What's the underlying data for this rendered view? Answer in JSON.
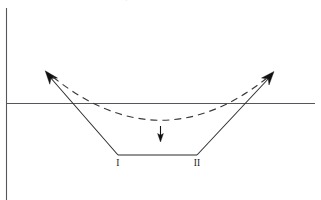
{
  "figure": {
    "background_color": "#ffffff",
    "width": 321,
    "height": 200,
    "cropped_caption_text": "schematic of the reaction coordinate profile",
    "labels": {
      "state_one": "I",
      "state_two": "II"
    },
    "colors": {
      "axis": "#55555c",
      "well_curve": "#2b2b2b",
      "dashed_curve": "#3a3a3a",
      "arrow": "#111111",
      "label_text": "#1b1b1b"
    },
    "axes": {
      "vertical": {
        "x": 6,
        "y_top": 8,
        "y_bottom": 200
      },
      "horizontal": {
        "y": 103,
        "x_left": 6,
        "x_right": 315
      }
    },
    "well": {
      "description": "solid trapezoidal potential well with arrowheads on both rising branches",
      "left_arrow_tip": {
        "x": 46,
        "y": 72
      },
      "bottom_left_corner": {
        "x": 118,
        "y": 155
      },
      "bottom_right_corner": {
        "x": 197,
        "y": 155
      },
      "right_arrow_tip": {
        "x": 273,
        "y": 73
      },
      "flat_bottom_y": 155
    },
    "dashed_curve": {
      "description": "smooth parabolic curve lying above the trapezoid",
      "left_end": {
        "x": 53,
        "y": 77
      },
      "minimum": {
        "x": 160,
        "y": 120
      },
      "right_end": {
        "x": 267,
        "y": 78
      }
    },
    "down_arrow": {
      "description": "short vertical arrow pointing down at the well center",
      "x": 160,
      "y_start": 126,
      "y_end": 141
    },
    "label_positions": {
      "state_one": {
        "x": 118,
        "y": 166
      },
      "state_two": {
        "x": 197,
        "y": 166
      }
    }
  }
}
